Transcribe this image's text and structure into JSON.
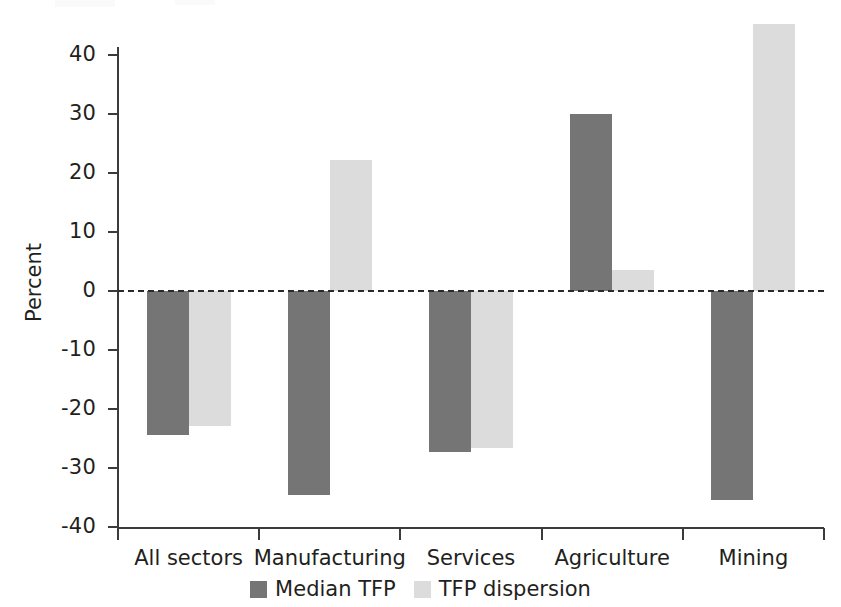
{
  "chart_data": {
    "type": "bar",
    "title": "",
    "subtitle": "",
    "xlabel": "",
    "ylabel": "Percent",
    "categories": [
      "All sectors",
      "Manufacturing",
      "Services",
      "Agriculture",
      "Mining"
    ],
    "series": [
      {
        "name": "Median TFP",
        "color": "#757575",
        "values": [
          -24.5,
          -34.7,
          -27.3,
          30.0,
          -35.5
        ]
      },
      {
        "name": "TFP dispersion",
        "color": "#dcdcdc",
        "values": [
          -23.0,
          22.3,
          -26.7,
          3.5,
          45.3
        ]
      }
    ],
    "ylim": [
      -40,
      45.5
    ],
    "yticks": [
      40,
      30,
      20,
      10,
      0,
      -10,
      -20,
      -30,
      -40
    ],
    "ytick_labels": [
      "40",
      "30",
      "20",
      "10",
      "0",
      "-10",
      "-20",
      "-30",
      "-40"
    ],
    "zero_line": 0,
    "zero_line_style": "dashed",
    "grid": false,
    "legend_position": "bottom-center"
  },
  "axis": {
    "y_title": "Percent"
  },
  "legend": {
    "entries": [
      {
        "label": "Median TFP",
        "color": "#757575"
      },
      {
        "label": "TFP dispersion",
        "color": "#dcdcdc"
      }
    ]
  }
}
